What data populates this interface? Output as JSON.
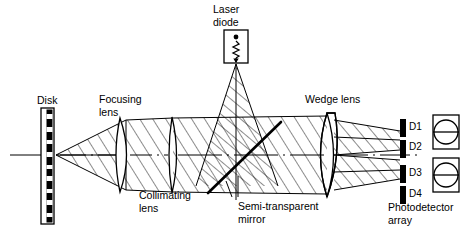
{
  "figure": {
    "background_color": "#ffffff",
    "line_color": "#000000",
    "width": 466,
    "height": 235
  },
  "labels": {
    "disk": "Disk",
    "focusing_lens_line1": "Focusing",
    "focusing_lens_line2": "lens",
    "collimating_lens_line1": "Collimating",
    "collimating_lens_line2": "lens",
    "laser_diode_line1": "Laser",
    "laser_diode_line2": "diode",
    "semi_transparent_mirror_line1": "Semi-transparent",
    "semi_transparent_mirror_line2": "mirror",
    "wedge_lens": "Wedge lens",
    "photodetector_array_line1": "Photodetector",
    "photodetector_array_line2": "array"
  },
  "detectors": [
    {
      "id": "D1",
      "label": "D1"
    },
    {
      "id": "D2",
      "label": "D2"
    },
    {
      "id": "D3",
      "label": "D3"
    },
    {
      "id": "D4",
      "label": "D4"
    }
  ],
  "components": {
    "disk": {
      "name": "disk",
      "track_pattern": "alternating pits",
      "pit_count": 11
    },
    "laser_diode": {
      "name": "laser-diode",
      "symbol": "dot-and-zigzag"
    },
    "semi_transparent_mirror": {
      "name": "semi-transparent-mirror",
      "orientation": "diagonal"
    },
    "wedge_lens": {
      "name": "wedge-lens"
    },
    "focusing_lens": {
      "name": "focusing-lens"
    },
    "collimating_lens": {
      "name": "collimating-lens"
    },
    "photodetector_array": {
      "name": "photodetector-array",
      "spot_boxes": 2,
      "spot_shape": "circle-with-split-line"
    }
  }
}
